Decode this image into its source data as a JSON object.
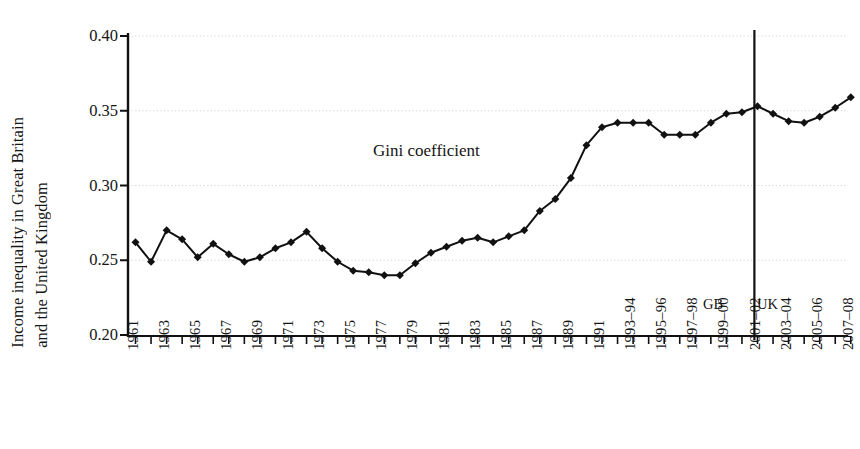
{
  "figure": {
    "ylabel_line1": "Income inequality in Great Britain",
    "ylabel_line2": "and the United Kingdom",
    "series_label": "Gini coefficient",
    "region_left_label": "GB",
    "region_right_label": "UK"
  },
  "chart_data": {
    "type": "line",
    "title": "",
    "xlabel": "",
    "ylabel": "Income inequality in Great Britain and the United Kingdom",
    "ylim": [
      0.2,
      0.4
    ],
    "yticks": [
      0.2,
      0.25,
      0.3,
      0.35,
      0.4
    ],
    "ytick_labels": [
      "0.20",
      "0.25",
      "0.30",
      "0.35",
      "0.40"
    ],
    "grid": "horizontal-dotted",
    "legend": "none",
    "annotations": [
      {
        "text": "Gini coefficient",
        "x_index": 15,
        "y": 0.318
      },
      {
        "text": "GB",
        "x_index": 38.1,
        "y": 0.218
      },
      {
        "text": "UK",
        "x_index": 41.5,
        "y": 0.218
      }
    ],
    "vertical_divider": {
      "x_index": 39.8,
      "label_left": "GB",
      "label_right": "UK"
    },
    "categories": [
      "1961",
      "1962",
      "1963",
      "1964",
      "1965",
      "1966",
      "1967",
      "1968",
      "1969",
      "1970",
      "1971",
      "1972",
      "1973",
      "1974",
      "1975",
      "1976",
      "1977",
      "1978",
      "1979",
      "1980",
      "1981",
      "1982",
      "1983",
      "1984",
      "1985",
      "1986",
      "1987",
      "1988",
      "1989",
      "1990",
      "1991",
      "1992",
      "1993-94",
      "1994-95",
      "1995-96",
      "1996-97",
      "1997-98",
      "1998-99",
      "1999-00",
      "2000-01",
      "2001-02",
      "2002-03",
      "2003-04",
      "2004-05",
      "2005-06",
      "2006-07",
      "2007-08"
    ],
    "xtick_labels": [
      "1961",
      "1963",
      "1965",
      "1967",
      "1969",
      "1971",
      "1973",
      "1975",
      "1977",
      "1979",
      "1981",
      "1983",
      "1985",
      "1987",
      "1989",
      "1991",
      "1993–94",
      "1995–96",
      "1997–98",
      "1999–00",
      "2001–02",
      "2003–04",
      "2005–06",
      "2007–08"
    ],
    "values": [
      0.262,
      0.249,
      0.27,
      0.264,
      0.252,
      0.261,
      0.254,
      0.249,
      0.252,
      0.258,
      0.262,
      0.269,
      0.258,
      0.249,
      0.243,
      0.242,
      0.24,
      0.24,
      0.248,
      0.255,
      0.259,
      0.263,
      0.265,
      0.262,
      0.266,
      0.27,
      0.283,
      0.291,
      0.305,
      0.327,
      0.339,
      0.342,
      0.342,
      0.342,
      0.334,
      0.334,
      0.334,
      0.342,
      0.348,
      0.349,
      0.353,
      0.348,
      0.343,
      0.342,
      0.346,
      0.352,
      0.359
    ],
    "marker": "diamond",
    "line_color": "#111111",
    "marker_color": "#111111"
  }
}
